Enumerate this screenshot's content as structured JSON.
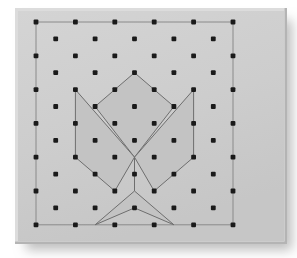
{
  "figure": {
    "type": "geoboard-lattice-figure",
    "canvas": {
      "width": 297,
      "height": 258
    },
    "colors": {
      "page_background": "#ffffff",
      "board_face": "#cdcdcd",
      "board_bevel_light": "#dcdcdc",
      "board_bevel_dark": "#b4b4b4",
      "board_edge_line": "#a8a8a8",
      "shadow": "#b9b9b9",
      "peg": "#1a1a1a",
      "band_stroke": "#6e6e6e",
      "band_fill": "#c3c3c3",
      "grid_outline": "#8a8a8a"
    },
    "board": {
      "x": 18,
      "y": 11,
      "width": 266,
      "height": 230,
      "bevel": 3,
      "shadow_offset_x": 8,
      "shadow_offset_y": 9,
      "shadow_blur": 6
    },
    "lattice": {
      "origin_x": 36,
      "origin_y": 22,
      "step_x": 39.4,
      "step_y": 33.8,
      "cols": 6,
      "rows": 7,
      "peg_radius": 2.4,
      "offset_peg_radius": 2.4,
      "description": "6x7 primary pegs plus 5x6 pegs offset to cell centers"
    },
    "outline_rect": {
      "label": "perimeter-band",
      "points": "0,0 5,0 5,6 0,6"
    },
    "polygons": [
      {
        "name": "top-kite",
        "label": "Top kite polygon",
        "grid_points": [
          [
            2.5,
            1.5
          ],
          [
            3.5,
            2.5
          ],
          [
            2.5,
            4.0
          ],
          [
            1.5,
            2.5
          ]
        ]
      },
      {
        "name": "left-wing",
        "label": "Left wing quadrilateral",
        "grid_points": [
          [
            1.0,
            2.0
          ],
          [
            2.5,
            4.0
          ],
          [
            2.0,
            5.0
          ],
          [
            1.0,
            4.0
          ]
        ]
      },
      {
        "name": "right-wing",
        "label": "Right wing quadrilateral",
        "grid_points": [
          [
            4.0,
            2.0
          ],
          [
            4.0,
            4.0
          ],
          [
            3.0,
            5.0
          ],
          [
            2.5,
            4.0
          ]
        ]
      },
      {
        "name": "bottom-dart",
        "label": "Bottom dart / arrow polygon",
        "grid_points": [
          [
            2.5,
            5.0
          ],
          [
            3.5,
            6.0
          ],
          [
            2.5,
            5.5
          ],
          [
            1.5,
            6.0
          ]
        ]
      }
    ],
    "segments": [
      {
        "name": "center-stem",
        "from": [
          2.5,
          4.0
        ],
        "to": [
          2.5,
          5.0
        ]
      }
    ]
  }
}
